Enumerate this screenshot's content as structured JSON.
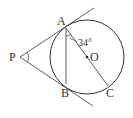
{
  "diagram": {
    "type": "geometry",
    "points": {
      "A": {
        "label": "A",
        "x": 66,
        "y": 28
      },
      "B": {
        "label": "B",
        "x": 66,
        "y": 84
      },
      "P": {
        "label": "P",
        "x": 20,
        "y": 57
      },
      "C": {
        "label": "C",
        "x": 108,
        "y": 86
      },
      "O": {
        "label": "O",
        "x": 87,
        "y": 57
      }
    },
    "circle": {
      "cx": 87,
      "cy": 57,
      "r": 37
    },
    "angle_label": "34°",
    "line_color": "#333333"
  }
}
